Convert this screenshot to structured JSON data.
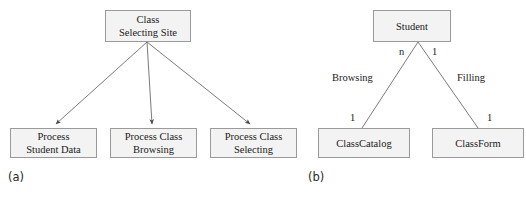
{
  "figure": {
    "panels": [
      {
        "caption": "(a)",
        "type": "data-flow-decomposition",
        "root": {
          "id": "class-selecting-site",
          "lines": [
            "Class",
            "Selecting Site"
          ],
          "x": 105,
          "y": 10,
          "w": 86,
          "h": 32
        },
        "children": [
          {
            "id": "process-student-data",
            "lines": [
              "Process",
              "Student Data"
            ],
            "x": 10,
            "y": 128,
            "w": 87,
            "h": 30
          },
          {
            "id": "process-class-browsing",
            "lines": [
              "Process Class",
              "Browsing"
            ],
            "x": 110,
            "y": 128,
            "w": 87,
            "h": 30
          },
          {
            "id": "process-class-selecting",
            "lines": [
              "Process Class",
              "Selecting"
            ],
            "x": 210,
            "y": 128,
            "w": 87,
            "h": 30
          }
        ],
        "caption_pos": {
          "x": 8,
          "y": 170
        }
      },
      {
        "caption": "(b)",
        "type": "entity-relationship",
        "root": {
          "id": "student",
          "lines": [
            "Student"
          ],
          "x": 373,
          "y": 10,
          "w": 78,
          "h": 32
        },
        "children": [
          {
            "id": "classcatalog",
            "lines": [
              "ClassCatalog"
            ],
            "x": 318,
            "y": 128,
            "w": 92,
            "h": 30
          },
          {
            "id": "classform",
            "lines": [
              "ClassForm"
            ],
            "x": 432,
            "y": 128,
            "w": 92,
            "h": 30
          }
        ],
        "relationships": [
          {
            "id": "browsing",
            "label": "Browsing",
            "label_x": 332,
            "label_y": 72,
            "top_card": "n",
            "top_card_x": 399,
            "top_card_y": 46,
            "bottom_card": "1",
            "bottom_card_x": 350,
            "bottom_card_y": 112
          },
          {
            "id": "filling",
            "label": "Filling",
            "label_x": 457,
            "label_y": 72,
            "top_card": "1",
            "top_card_x": 432,
            "top_card_y": 46,
            "bottom_card": "1",
            "bottom_card_x": 487,
            "bottom_card_y": 112
          }
        ],
        "caption_pos": {
          "x": 308,
          "y": 170
        }
      }
    ]
  },
  "style": {
    "box_fill": "#f3f3f3",
    "box_stroke": "#9a9a9a",
    "line_stroke": "#6b6b72",
    "text_color": "#1a1a1a",
    "background": "#ffffff"
  }
}
